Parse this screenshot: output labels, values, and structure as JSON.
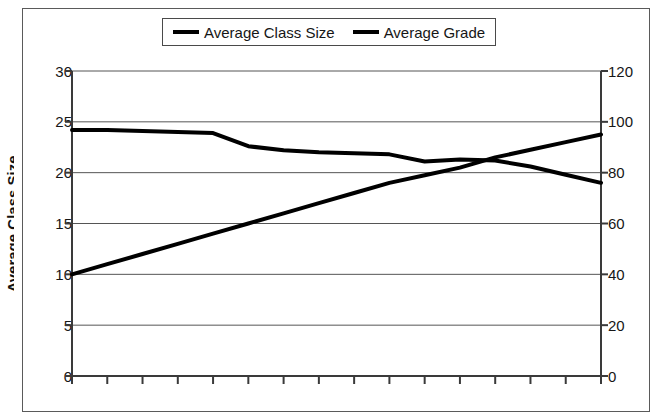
{
  "chart_data": {
    "type": "line",
    "title": "",
    "xlabel": "",
    "ylabel": "Average Class Size",
    "y2label": "Average Grade",
    "grid": true,
    "legend_position": "top-center",
    "ylim": [
      0,
      30
    ],
    "y2lim": [
      0,
      120
    ],
    "yticks": [
      "0",
      "5",
      "10",
      "15",
      "20",
      "25",
      "30"
    ],
    "y2ticks": [
      "0",
      "20",
      "40",
      "60",
      "80",
      "100",
      "120"
    ],
    "xticks": [
      "",
      "",
      "",
      "",
      "",
      "",
      "",
      "",
      "",
      "",
      "",
      "",
      "",
      "",
      "",
      ""
    ],
    "xtick_count": 16,
    "x": [
      0,
      1,
      2,
      3,
      4,
      5,
      6,
      7,
      8,
      9,
      10,
      11,
      12,
      13,
      14,
      15
    ],
    "series": [
      {
        "name": "Average Class Size",
        "axis": "left",
        "color": "#000000",
        "values": [
          24.2,
          24.2,
          24.1,
          24.0,
          23.9,
          22.6,
          22.2,
          22.0,
          21.9,
          21.8,
          21.1,
          21.3,
          21.2,
          20.6,
          19.8,
          19.0
        ]
      },
      {
        "name": "Average Grade",
        "axis": "right",
        "color": "#000000",
        "values": [
          40,
          44,
          48,
          52,
          56,
          60,
          64,
          68,
          72,
          76,
          79,
          82,
          86,
          89,
          92,
          95
        ]
      }
    ]
  },
  "legend": {
    "entries": [
      {
        "label": "Average Class Size",
        "swatch": "line-swatch-icon"
      },
      {
        "label": "Average Grade",
        "swatch": "line-swatch-icon"
      }
    ]
  },
  "axes": {
    "left_title_cropped": "Average Class Size",
    "left_ticks": [
      "30",
      "25",
      "20",
      "15",
      "10",
      "5",
      "0"
    ],
    "right_ticks": [
      "120",
      "100",
      "80",
      "60",
      "40",
      "20",
      "0"
    ]
  }
}
